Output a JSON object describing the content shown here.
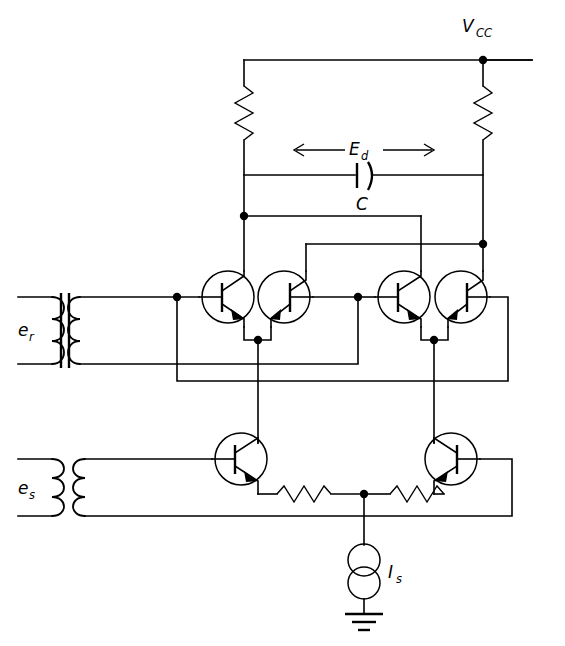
{
  "figure": {
    "kind": "circuit-schematic",
    "background_color": "#ffffff",
    "line_color": "#000000",
    "width": 565,
    "height": 646
  },
  "labels": {
    "supply": {
      "main": "V",
      "sub": "CC"
    },
    "diff_voltage": {
      "main": "E",
      "sub": "d"
    },
    "capacitor": {
      "main": "C",
      "sub": ""
    },
    "reference_input": {
      "main": "e",
      "sub": "r"
    },
    "signal_input": {
      "main": "e",
      "sub": "s"
    },
    "current_source": {
      "main": "I",
      "sub": "s"
    }
  },
  "components": {
    "resistors": [
      {
        "name": "collector-load-resistor-left",
        "orientation": "vertical"
      },
      {
        "name": "collector-load-resistor-right",
        "orientation": "vertical"
      },
      {
        "name": "emitter-degeneration-resistor-left",
        "orientation": "horizontal"
      },
      {
        "name": "emitter-degeneration-resistor-right",
        "orientation": "horizontal"
      }
    ],
    "transistors": [
      {
        "name": "transistor-q1",
        "type": "npn",
        "mirrored": false,
        "row": "upper"
      },
      {
        "name": "transistor-q2",
        "type": "npn",
        "mirrored": true,
        "row": "upper"
      },
      {
        "name": "transistor-q3",
        "type": "npn",
        "mirrored": false,
        "row": "upper"
      },
      {
        "name": "transistor-q4",
        "type": "npn",
        "mirrored": true,
        "row": "upper"
      },
      {
        "name": "transistor-q5",
        "type": "npn",
        "mirrored": false,
        "row": "lower"
      },
      {
        "name": "transistor-q6",
        "type": "npn",
        "mirrored": true,
        "row": "lower"
      }
    ],
    "transformers": [
      {
        "name": "transformer-er",
        "label": "e_r",
        "core": "iron",
        "turns": 3
      },
      {
        "name": "transformer-es",
        "label": "e_s",
        "core": "air",
        "turns": 3
      }
    ],
    "capacitors": [
      {
        "name": "output-capacitor-c",
        "style": "curved-plate"
      }
    ],
    "sources": [
      {
        "name": "current-source-is",
        "style": "double-circle"
      }
    ],
    "grounds": [
      {
        "name": "ground-symbol",
        "bars": 3
      }
    ],
    "nodes_count": 10,
    "arrows": [
      {
        "name": "ed-arrow-left",
        "direction": "left"
      },
      {
        "name": "ed-arrow-right",
        "direction": "right"
      }
    ]
  }
}
